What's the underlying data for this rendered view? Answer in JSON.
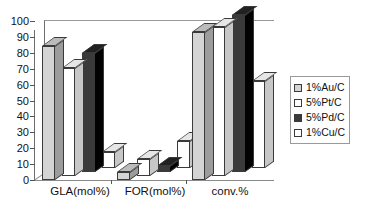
{
  "chart_data": {
    "type": "bar",
    "title": "",
    "subtitle": "",
    "xlabel": "",
    "ylabel": "",
    "ylim": [
      0,
      100
    ],
    "ytick_step": 10,
    "yticks": [
      0,
      10,
      20,
      30,
      40,
      50,
      60,
      70,
      80,
      90,
      100
    ],
    "grid": false,
    "three_d": true,
    "legend_position": "right",
    "categories": [
      "GLA(mol%)",
      "FOR(mol%)",
      "conv.%"
    ],
    "series": [
      {
        "name": "1%Au/C",
        "color": "#d4d4d4",
        "values": [
          84,
          5,
          93
        ]
      },
      {
        "name": "5%Pt/C",
        "color": "#ffffff",
        "values": [
          68,
          11,
          94
        ]
      },
      {
        "name": "5%Pd/C",
        "color": "#3a3a3a",
        "values": [
          75,
          4,
          99
        ]
      },
      {
        "name": "1%Cu/C",
        "color": "#ffffff",
        "values": [
          10,
          17,
          55
        ]
      }
    ]
  },
  "legend": {
    "items": [
      {
        "label": "1%Au/C",
        "swatch": "#d4d4d4"
      },
      {
        "label": "5%Pt/C",
        "swatch": "#ffffff"
      },
      {
        "label": "5%Pd/C",
        "swatch": "#3a3a3a"
      },
      {
        "label": "1%Cu/C",
        "swatch": "#ffffff"
      }
    ]
  },
  "axis": {
    "y_labels": [
      "100",
      "90",
      "80",
      "70",
      "60",
      "50",
      "40",
      "30",
      "20",
      "10",
      "0"
    ],
    "x_labels": [
      "GLA(mol%)",
      "FOR(mol%)",
      "conv.%"
    ]
  }
}
